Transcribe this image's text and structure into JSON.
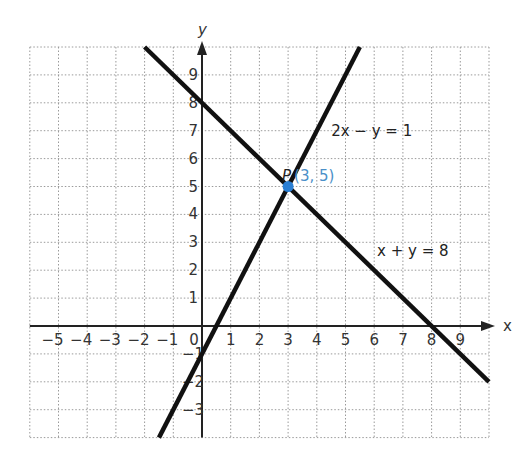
{
  "chart_data": {
    "type": "line",
    "title": "",
    "xlabel": "x",
    "ylabel": "y",
    "xlim": [
      -6,
      10
    ],
    "ylim": [
      -4,
      10
    ],
    "grid": true,
    "x_ticks": [
      "-5",
      "-4",
      "-3",
      "-2",
      "-1",
      "0",
      "1",
      "2",
      "3",
      "4",
      "5",
      "6",
      "7",
      "8",
      "9"
    ],
    "x_tick_values": [
      -5,
      -4,
      -3,
      -2,
      -1,
      0,
      1,
      2,
      3,
      4,
      5,
      6,
      7,
      8,
      9
    ],
    "y_ticks": [
      "9",
      "8",
      "7",
      "6",
      "5",
      "4",
      "3",
      "2",
      "1",
      "-1",
      "-2",
      "-3"
    ],
    "y_tick_values": [
      9,
      8,
      7,
      6,
      5,
      4,
      3,
      2,
      1,
      -1,
      -2,
      -3
    ],
    "series": [
      {
        "name": "x + y = 8",
        "label": "x + y = 8",
        "x": [
          -2,
          10
        ],
        "y": [
          10,
          -2
        ],
        "color": "#111111"
      },
      {
        "name": "2x - y = 1",
        "label": "2x − y = 1",
        "x": [
          -1.5,
          5.5
        ],
        "y": [
          -4,
          10
        ],
        "color": "#111111"
      }
    ],
    "points": [
      {
        "name": "P",
        "label": "P",
        "coord_label": "(3, 5)",
        "x": 3,
        "y": 5,
        "color": "#2a7fd4"
      }
    ]
  }
}
